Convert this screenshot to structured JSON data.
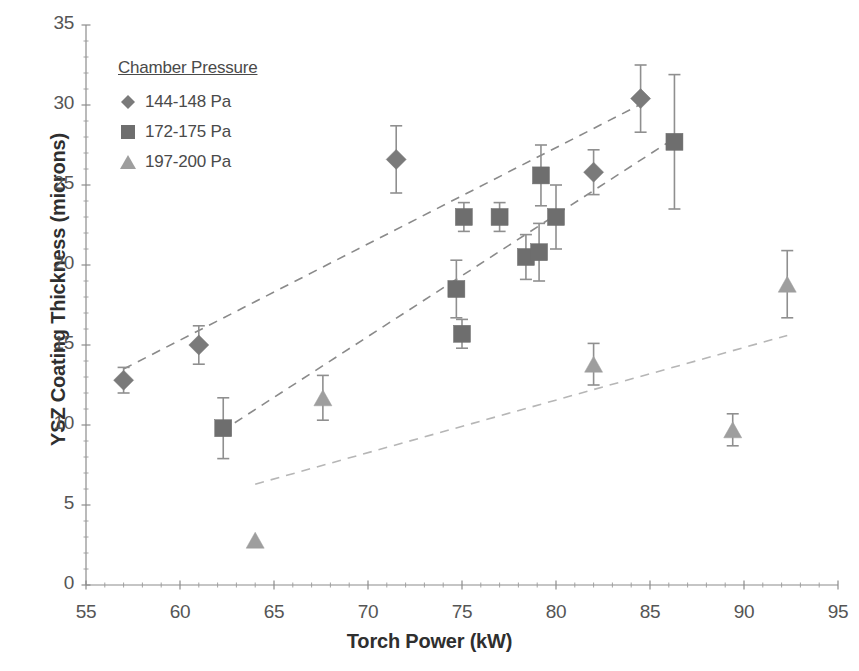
{
  "chart_data": {
    "type": "scatter",
    "title": "",
    "xlabel": "Torch Power (kW)",
    "ylabel": "YSZ Coating Thickness (microns)",
    "xlim": [
      55,
      95
    ],
    "ylim": [
      0,
      35
    ],
    "xticks": [
      55,
      60,
      65,
      70,
      75,
      80,
      85,
      90,
      95
    ],
    "yticks": [
      0,
      5,
      10,
      15,
      20,
      25,
      30,
      35
    ],
    "x_minor_step": 1,
    "y_minor_step": 1,
    "grid": false,
    "legend_position": "upper-left-inside",
    "legend_title": "Chamber Pressure",
    "series": [
      {
        "name": "144-148 Pa",
        "marker": "diamond",
        "color": "#7a7a7a",
        "points": [
          {
            "x": 57.0,
            "y": 12.8,
            "yerr": 0.8
          },
          {
            "x": 61.0,
            "y": 15.0,
            "yerr": 1.2
          },
          {
            "x": 71.5,
            "y": 26.6,
            "yerr": 2.1
          },
          {
            "x": 82.0,
            "y": 25.8,
            "yerr": 1.4
          },
          {
            "x": 84.5,
            "y": 30.4,
            "yerr": 2.1
          }
        ],
        "trendline": {
          "x0": 57.0,
          "y0": 13.5,
          "x1": 84.6,
          "y1": 30.1
        }
      },
      {
        "name": "172-175 Pa",
        "marker": "square",
        "color": "#6e6e6e",
        "points": [
          {
            "x": 62.3,
            "y": 9.8,
            "yerr": 1.9
          },
          {
            "x": 74.7,
            "y": 18.5,
            "yerr": 1.8
          },
          {
            "x": 75.0,
            "y": 15.7,
            "yerr": 0.9
          },
          {
            "x": 75.1,
            "y": 23.0,
            "yerr": 0.9
          },
          {
            "x": 77.0,
            "y": 23.0,
            "yerr": 0.9
          },
          {
            "x": 78.4,
            "y": 20.5,
            "yerr": 1.4
          },
          {
            "x": 79.1,
            "y": 20.8,
            "yerr": 1.8
          },
          {
            "x": 79.2,
            "y": 25.6,
            "yerr": 1.9
          },
          {
            "x": 80.0,
            "y": 23.0,
            "yerr": 2.0
          },
          {
            "x": 86.3,
            "y": 27.7,
            "yerr": 4.2
          }
        ],
        "trendline": {
          "x0": 62.2,
          "y0": 9.6,
          "x1": 86.4,
          "y1": 28.0
        }
      },
      {
        "name": "197-200 Pa",
        "marker": "triangle",
        "color": "#9e9e9e",
        "points": [
          {
            "x": 64.0,
            "y": 2.8,
            "yerr": 0.0
          },
          {
            "x": 67.6,
            "y": 11.7,
            "yerr": 1.4
          },
          {
            "x": 82.0,
            "y": 13.8,
            "yerr": 1.3
          },
          {
            "x": 89.4,
            "y": 9.7,
            "yerr": 1.0
          },
          {
            "x": 92.3,
            "y": 18.8,
            "yerr": 2.1
          }
        ],
        "trendline": {
          "x0": 64.0,
          "y0": 6.3,
          "x1": 92.3,
          "y1": 15.6
        }
      }
    ]
  },
  "axes": {
    "x_tick_labels": [
      "55",
      "60",
      "65",
      "70",
      "75",
      "80",
      "85",
      "90",
      "95"
    ],
    "y_tick_labels": [
      "0",
      "5",
      "10",
      "15",
      "20",
      "25",
      "30",
      "35"
    ],
    "x_title": "Torch Power (kW)",
    "y_title": "YSZ Coating Thickness (microns)"
  },
  "legend": {
    "title": "Chamber Pressure",
    "entries": [
      {
        "label": "144-148 Pa",
        "marker": "diamond-marker-icon",
        "color": "#7a7a7a"
      },
      {
        "label": "172-175 Pa",
        "marker": "square-marker-icon",
        "color": "#6e6e6e"
      },
      {
        "label": "197-200 Pa",
        "marker": "triangle-marker-icon",
        "color": "#9e9e9e"
      }
    ]
  },
  "style": {
    "axis_color": "#8c8c8c",
    "tick_color": "#9a9a9a",
    "text_color": "#4a4a4a",
    "trend_color_1": "#8a8a8a",
    "trend_color_2": "#8a8a8a",
    "trend_color_3": "#b6b6b6",
    "background": "#ffffff"
  }
}
